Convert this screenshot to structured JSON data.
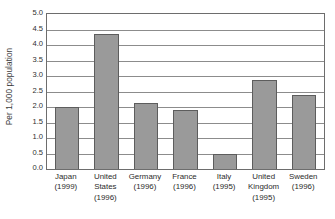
{
  "chart_data": {
    "type": "bar",
    "title": "",
    "subtitle": "",
    "xlabel": "",
    "ylabel": "Per 1,000 population",
    "ylim": [
      0.0,
      5.0
    ],
    "ytick_labels": [
      "5.0",
      "4.5",
      "4.0",
      "3.5",
      "3.0",
      "2.5",
      "2.0",
      "1.5",
      "1.0",
      "0.5",
      "0.0"
    ],
    "ytick_values": [
      5.0,
      4.5,
      4.0,
      3.5,
      3.0,
      2.5,
      2.0,
      1.5,
      1.0,
      0.5,
      0.0
    ],
    "grid": "horizontal",
    "legend": "none",
    "bar_color": "#9a9a9a",
    "bar_border_color": "#5d5d5d",
    "axis_color": "#6d6d6d",
    "gridline_color": "#8c8c8c",
    "categories": [
      "Japan (1999)",
      "United States (1996)",
      "Germany (1996)",
      "France (1996)",
      "Italy (1995)",
      "United Kingdom (1995)",
      "Sweden (1996)"
    ],
    "category_lines": [
      [
        "Japan",
        "(1999)"
      ],
      [
        "United",
        "States",
        "(1996)"
      ],
      [
        "Germany",
        "(1996)"
      ],
      [
        "France",
        "(1996)"
      ],
      [
        "Italy",
        "(1995)"
      ],
      [
        "United",
        "Kingdom",
        "(1995)"
      ],
      [
        "Sweden",
        "(1996)"
      ]
    ],
    "values": [
      2.0,
      4.34,
      2.13,
      1.89,
      0.47,
      2.88,
      2.4
    ]
  }
}
